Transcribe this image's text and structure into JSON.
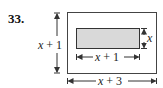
{
  "problem": {
    "number": "33.",
    "labels": {
      "outer_height": "x + 1",
      "inner_height": "x",
      "inner_width": "x + 1",
      "outer_width": "x + 3"
    },
    "colors": {
      "outer_stroke": "#444444",
      "inner_fill": "#d9d9d9",
      "inner_stroke": "#333333",
      "arrow": "#333333"
    }
  }
}
